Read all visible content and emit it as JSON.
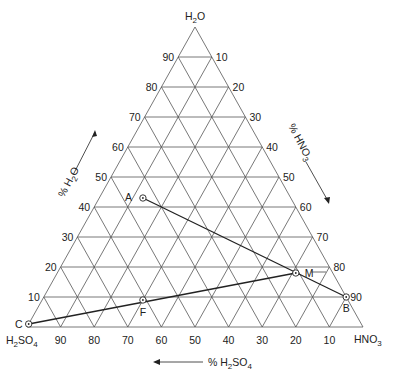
{
  "diagram": {
    "type": "ternary",
    "vertices": {
      "top": {
        "label": "H2O",
        "sub": "2",
        "html": [
          "H",
          "2",
          "O"
        ]
      },
      "left": {
        "label": "H2SO4",
        "parts": [
          "H",
          "2",
          "SO",
          "4"
        ]
      },
      "right": {
        "label": "HNO3",
        "parts": [
          "HNO",
          "3"
        ]
      }
    },
    "axis_titles": {
      "water": "% H2O",
      "nitric": "% HNO3",
      "sulfuric": "% H2SO4"
    },
    "left_ticks": [
      "90",
      "80",
      "70",
      "60",
      "50",
      "40",
      "30",
      "20",
      "10"
    ],
    "right_ticks": [
      "10",
      "20",
      "30",
      "40",
      "50",
      "60",
      "70",
      "80",
      "90"
    ],
    "bottom_ticks": [
      "90",
      "80",
      "70",
      "60",
      "50",
      "40",
      "30",
      "20",
      "10"
    ],
    "points": [
      {
        "id": "A",
        "h2o": 43,
        "hno3": 13,
        "h2so4": 44
      },
      {
        "id": "B",
        "h2o": 10,
        "hno3": 90,
        "h2so4": 0
      },
      {
        "id": "M",
        "h2o": 18,
        "hno3": 71,
        "h2so4": 11
      },
      {
        "id": "F",
        "h2o": 9,
        "hno3": 30,
        "h2so4": 61
      },
      {
        "id": "C",
        "h2o": 1,
        "hno3": 0,
        "h2so4": 99
      }
    ],
    "tie_lines": [
      [
        "A",
        "B"
      ],
      [
        "C",
        "M"
      ]
    ],
    "colors": {
      "grid": "#555555",
      "text": "#222222",
      "line": "#222222"
    }
  }
}
